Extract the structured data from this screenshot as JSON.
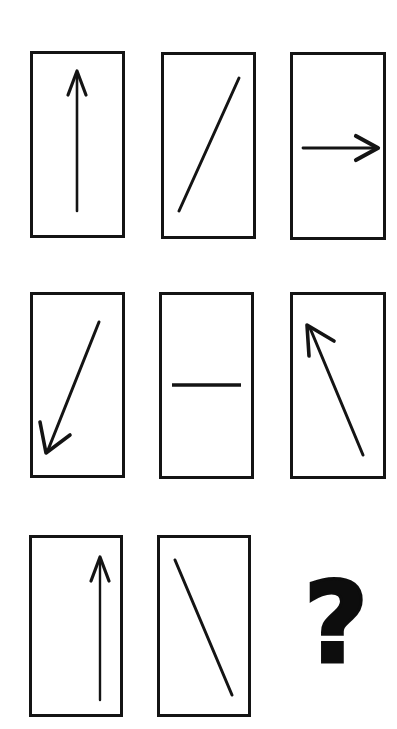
{
  "puzzle": {
    "type": "matrix-reasoning",
    "title": "Arrow Matrix Puzzle",
    "rows": 3,
    "columns": 3,
    "background_color": "#ffffff",
    "stroke_color": "#141414",
    "cell_width": 95,
    "cell_height": 187,
    "border_width": 3,
    "cells": [
      {
        "id": "cell-1",
        "row": 1,
        "column": 1,
        "x": 30,
        "y": 51,
        "width": 95,
        "height": 187,
        "figure": "arrow",
        "direction": "up",
        "has_arrowhead": true,
        "x1": 47,
        "y1": 160,
        "x2": 47,
        "y2": 22,
        "description": "vertical arrow pointing up"
      },
      {
        "id": "cell-2",
        "row": 1,
        "column": 2,
        "x": 161,
        "y": 52,
        "width": 95,
        "height": 187,
        "figure": "line",
        "direction": "up-right",
        "has_arrowhead": false,
        "x1": 18,
        "y1": 159,
        "x2": 78,
        "y2": 26,
        "description": "diagonal line rising to the right, no arrowhead"
      },
      {
        "id": "cell-3",
        "row": 1,
        "column": 3,
        "x": 290,
        "y": 52,
        "width": 96,
        "height": 188,
        "figure": "arrow",
        "direction": "right",
        "has_arrowhead": true,
        "x1": 13,
        "y1": 96,
        "x2": 86,
        "y2": 96,
        "description": "horizontal arrow pointing right"
      },
      {
        "id": "cell-4",
        "row": 2,
        "column": 1,
        "x": 30,
        "y": 292,
        "width": 95,
        "height": 186,
        "figure": "arrow",
        "direction": "down-left",
        "has_arrowhead": true,
        "x1": 69,
        "y1": 30,
        "x2": 18,
        "y2": 158,
        "description": "diagonal arrow pointing down-left"
      },
      {
        "id": "cell-5",
        "row": 2,
        "column": 2,
        "x": 159,
        "y": 292,
        "width": 95,
        "height": 187,
        "figure": "line",
        "direction": "horizontal",
        "has_arrowhead": false,
        "x1": 13,
        "y1": 93,
        "x2": 82,
        "y2": 93,
        "description": "horizontal line, no arrowhead"
      },
      {
        "id": "cell-6",
        "row": 2,
        "column": 3,
        "x": 290,
        "y": 292,
        "width": 96,
        "height": 187,
        "figure": "arrow",
        "direction": "up-left",
        "has_arrowhead": true,
        "x1": 73,
        "y1": 163,
        "x2": 20,
        "y2": 36,
        "description": "diagonal arrow pointing up-left"
      },
      {
        "id": "cell-7",
        "row": 3,
        "column": 1,
        "x": 29,
        "y": 535,
        "width": 94,
        "height": 182,
        "figure": "arrow",
        "direction": "up",
        "has_arrowhead": true,
        "x1": 71,
        "y1": 165,
        "x2": 71,
        "y2": 23,
        "description": "vertical arrow pointing up, offset to the right"
      },
      {
        "id": "cell-8",
        "row": 3,
        "column": 2,
        "x": 157,
        "y": 535,
        "width": 94,
        "height": 182,
        "figure": "line",
        "direction": "down-right",
        "has_arrowhead": false,
        "x1": 18,
        "y1": 25,
        "x2": 75,
        "y2": 160,
        "description": "diagonal line falling to the right, no arrowhead"
      }
    ],
    "answer_slot": {
      "id": "cell-9",
      "row": 3,
      "column": 3,
      "x": 296,
      "y": 565,
      "width": 80,
      "height": 115,
      "symbol": "?",
      "label": "unknown-answer",
      "description": "missing cell indicated by a bold question mark"
    }
  }
}
